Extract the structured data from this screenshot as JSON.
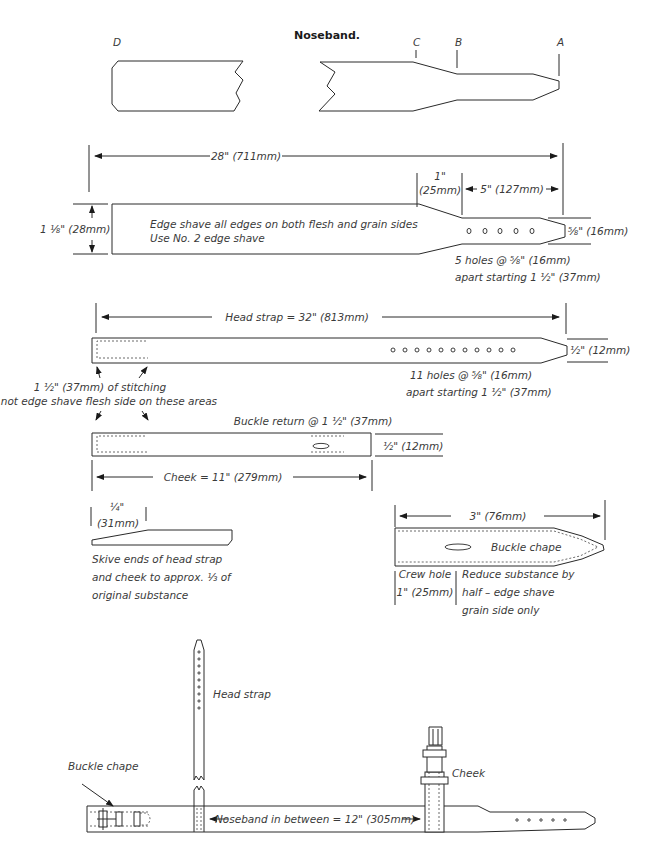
{
  "title": "Noseband.",
  "point_labels": {
    "a": "A",
    "b": "B",
    "c": "C",
    "d": "D"
  },
  "noseband": {
    "length": "28\" (711mm)",
    "width": "1 ⅛\" (28mm)",
    "taper": "1\"",
    "taper_mm": "(25mm)",
    "tip_length": "5\" (127mm)",
    "tip_width": "⅝\" (16mm)",
    "note_line1": "Edge shave all edges on both flesh and grain sides",
    "note_line2": "Use No. 2 edge shave",
    "holes_line1": "5 holes @ ⅝\" (16mm)",
    "holes_line2": "apart starting 1 ½\" (37mm)",
    "hole_count": 5
  },
  "head_strap": {
    "length": "Head strap = 32\" (813mm)",
    "tip_width": "½\" (12mm)",
    "holes_line1": "11 holes @ ⅝\" (16mm)",
    "holes_line2": "apart starting 1 ½\" (37mm)",
    "hole_count": 11,
    "stitch_line1": "1 ½\" (37mm) of stitching",
    "stitch_line2": "Do not edge shave flesh side on these areas"
  },
  "cheek": {
    "buckle_return": "Buckle return @ 1 ½\" (37mm)",
    "width": "½\" (12mm)",
    "length": "Cheek = 11\" (279mm)"
  },
  "skive": {
    "width": "¼\"",
    "width_mm": "(31mm)",
    "line1": "Skive ends of head strap",
    "line2": "and cheek to approx. ⅓ of",
    "line3": "original substance"
  },
  "buckle_chape": {
    "length": "3\" (76mm)",
    "label": "Buckle chape",
    "crew_line1": "Crew hole",
    "crew_line2": "1\" (25mm)",
    "reduce_line1": "Reduce substance by",
    "reduce_line2": "half – edge shave",
    "reduce_line3": "grain side only"
  },
  "assembly": {
    "head_strap_label": "Head strap",
    "cheek_label": "Cheek",
    "buckle_chape_label": "Buckle chape",
    "between": "Noseband in between = 12\" (305mm)"
  }
}
